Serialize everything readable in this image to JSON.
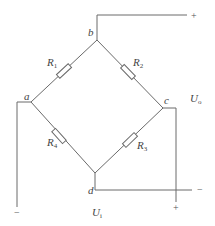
{
  "diagram": {
    "type": "wheatstone-bridge",
    "nodes": [
      {
        "id": "a",
        "label": "a"
      },
      {
        "id": "b",
        "label": "b"
      },
      {
        "id": "c",
        "label": "c"
      },
      {
        "id": "d",
        "label": "d"
      }
    ],
    "resistors": [
      {
        "id": "R1",
        "label": "R",
        "sub": "1",
        "between": [
          "a",
          "b"
        ]
      },
      {
        "id": "R2",
        "label": "R",
        "sub": "2",
        "between": [
          "b",
          "c"
        ]
      },
      {
        "id": "R3",
        "label": "R",
        "sub": "3",
        "between": [
          "c",
          "d"
        ]
      },
      {
        "id": "R4",
        "label": "R",
        "sub": "4",
        "between": [
          "d",
          "a"
        ]
      }
    ],
    "output": {
      "label": "U",
      "sub": "o",
      "plus": "+",
      "minus": "−",
      "terminals": [
        "b",
        "d"
      ]
    },
    "input": {
      "label": "U",
      "sub": "i",
      "plus": "+",
      "minus": "−",
      "terminals": [
        "c",
        "a"
      ]
    },
    "colors": {
      "line": "#6a6a6a",
      "text": "#444444",
      "background": "#ffffff"
    }
  }
}
